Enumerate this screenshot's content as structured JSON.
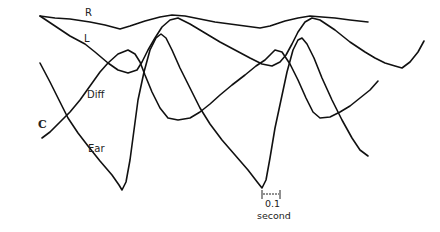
{
  "figure": {
    "panel_label": "C",
    "trace_labels": {
      "R": "R",
      "L": "L",
      "Diff": "Diff",
      "Ear": "Ear"
    },
    "scale_bar": {
      "value": "0.1",
      "unit": "second"
    },
    "stroke_color": "#111111",
    "background": "#ffffff"
  },
  "chart_data": {
    "type": "line",
    "title": "",
    "panel": "C",
    "xlabel": "time",
    "ylabel": "",
    "grid": false,
    "legend": "inline labels",
    "scale_bar": {
      "length_label": "0.1 second",
      "pixel_length": 18
    },
    "coordinate_space": "pixel (x right, y down), 440x232",
    "series": [
      {
        "name": "R",
        "points": [
          [
            40,
            16
          ],
          [
            55,
            18
          ],
          [
            70,
            19
          ],
          [
            90,
            22
          ],
          [
            105,
            25
          ],
          [
            120,
            29
          ],
          [
            130,
            26
          ],
          [
            145,
            21
          ],
          [
            160,
            17
          ],
          [
            172,
            15
          ],
          [
            185,
            16
          ],
          [
            200,
            19
          ],
          [
            215,
            22
          ],
          [
            230,
            24
          ],
          [
            245,
            26
          ],
          [
            260,
            28
          ],
          [
            270,
            26
          ],
          [
            285,
            21
          ],
          [
            298,
            18
          ],
          [
            310,
            16
          ],
          [
            322,
            17
          ],
          [
            335,
            18
          ],
          [
            350,
            20
          ],
          [
            368,
            22
          ]
        ]
      },
      {
        "name": "L",
        "points": [
          [
            40,
            16
          ],
          [
            55,
            26
          ],
          [
            70,
            36
          ],
          [
            85,
            44
          ],
          [
            95,
            52
          ],
          [
            108,
            63
          ],
          [
            118,
            70
          ],
          [
            128,
            73
          ],
          [
            137,
            70
          ],
          [
            142,
            62
          ],
          [
            148,
            50
          ],
          [
            155,
            38
          ],
          [
            162,
            27
          ],
          [
            170,
            20
          ],
          [
            178,
            18
          ],
          [
            190,
            24
          ],
          [
            205,
            33
          ],
          [
            220,
            42
          ],
          [
            235,
            50
          ],
          [
            250,
            58
          ],
          [
            262,
            64
          ],
          [
            272,
            66
          ],
          [
            280,
            62
          ],
          [
            286,
            55
          ],
          [
            292,
            44
          ],
          [
            298,
            32
          ],
          [
            305,
            22
          ],
          [
            312,
            18
          ],
          [
            320,
            20
          ],
          [
            335,
            30
          ],
          [
            350,
            42
          ],
          [
            365,
            52
          ],
          [
            375,
            58
          ],
          [
            385,
            63
          ],
          [
            395,
            66
          ],
          [
            402,
            68
          ],
          [
            410,
            62
          ],
          [
            418,
            52
          ],
          [
            424,
            41
          ]
        ]
      },
      {
        "name": "Diff",
        "points": [
          [
            42,
            138
          ],
          [
            50,
            132
          ],
          [
            60,
            122
          ],
          [
            70,
            112
          ],
          [
            80,
            100
          ],
          [
            90,
            86
          ],
          [
            100,
            72
          ],
          [
            108,
            63
          ],
          [
            118,
            54
          ],
          [
            128,
            50
          ],
          [
            135,
            54
          ],
          [
            140,
            62
          ],
          [
            145,
            75
          ],
          [
            152,
            92
          ],
          [
            160,
            108
          ],
          [
            168,
            118
          ],
          [
            178,
            120
          ],
          [
            190,
            118
          ],
          [
            200,
            112
          ],
          [
            210,
            104
          ],
          [
            220,
            95
          ],
          [
            232,
            85
          ],
          [
            245,
            75
          ],
          [
            256,
            66
          ],
          [
            265,
            60
          ],
          [
            275,
            50
          ],
          [
            282,
            52
          ],
          [
            290,
            64
          ],
          [
            298,
            80
          ],
          [
            306,
            98
          ],
          [
            313,
            112
          ],
          [
            320,
            118
          ],
          [
            330,
            117
          ],
          [
            340,
            112
          ],
          [
            350,
            106
          ],
          [
            360,
            98
          ],
          [
            370,
            90
          ],
          [
            378,
            81
          ]
        ]
      },
      {
        "name": "Ear",
        "points": [
          [
            40,
            63
          ],
          [
            50,
            82
          ],
          [
            60,
            102
          ],
          [
            68,
            118
          ],
          [
            78,
            133
          ],
          [
            88,
            146
          ],
          [
            100,
            161
          ],
          [
            112,
            175
          ],
          [
            119,
            185
          ],
          [
            122,
            190
          ],
          [
            126,
            182
          ],
          [
            130,
            160
          ],
          [
            134,
            130
          ],
          [
            138,
            100
          ],
          [
            144,
            72
          ],
          [
            150,
            50
          ],
          [
            156,
            38
          ],
          [
            161,
            34
          ],
          [
            166,
            38
          ],
          [
            172,
            50
          ],
          [
            180,
            68
          ],
          [
            190,
            88
          ],
          [
            200,
            108
          ],
          [
            210,
            124
          ],
          [
            222,
            140
          ],
          [
            235,
            155
          ],
          [
            248,
            170
          ],
          [
            258,
            183
          ],
          [
            262,
            188
          ],
          [
            266,
            180
          ],
          [
            270,
            158
          ],
          [
            275,
            128
          ],
          [
            281,
            100
          ],
          [
            287,
            72
          ],
          [
            293,
            50
          ],
          [
            298,
            40
          ],
          [
            302,
            38
          ],
          [
            307,
            44
          ],
          [
            314,
            58
          ],
          [
            322,
            78
          ],
          [
            332,
            100
          ],
          [
            342,
            120
          ],
          [
            352,
            138
          ],
          [
            360,
            150
          ],
          [
            368,
            156
          ]
        ]
      }
    ]
  }
}
